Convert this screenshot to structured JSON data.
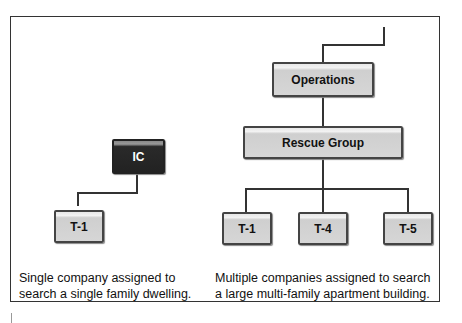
{
  "diagram": {
    "left": {
      "nodes": [
        {
          "id": "ic",
          "label": "IC",
          "style": "dark"
        },
        {
          "id": "t1-left",
          "label": "T-1",
          "style": "light"
        }
      ],
      "caption": [
        "Single company assigned to",
        "search a single family dwelling."
      ]
    },
    "right": {
      "nodes": [
        {
          "id": "operations",
          "label": "Operations"
        },
        {
          "id": "rescue-group",
          "label": "Rescue Group"
        },
        {
          "id": "t1",
          "label": "T-1"
        },
        {
          "id": "t4",
          "label": "T-4"
        },
        {
          "id": "t5",
          "label": "T-5"
        }
      ],
      "caption": [
        "Multiple companies assigned to search",
        "a large multi-family apartment building."
      ]
    },
    "edges": [
      [
        "ic",
        "t1-left"
      ],
      [
        "external",
        "operations"
      ],
      [
        "operations",
        "rescue-group"
      ],
      [
        "rescue-group",
        "t1"
      ],
      [
        "rescue-group",
        "t4"
      ],
      [
        "rescue-group",
        "t5"
      ]
    ],
    "colors": {
      "box_fill": "#d6d6d6",
      "dark_box_fill": "#222222",
      "line": "#333333"
    }
  }
}
